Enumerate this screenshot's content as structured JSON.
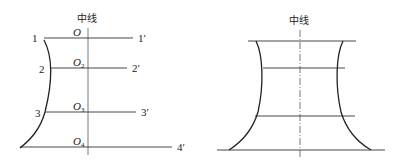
{
  "left_diagram": {
    "centerline_label": "中线",
    "origin_label": "O",
    "section_labels_left": [
      "1",
      "2",
      "3"
    ],
    "section_labels_right": [
      "1′",
      "2′",
      "3′",
      "4′"
    ],
    "center_points": [
      {
        "base": "O",
        "sub": ""
      },
      {
        "base": "O",
        "sub": "2"
      },
      {
        "base": "O",
        "sub": "3"
      },
      {
        "base": "O",
        "sub": "4"
      }
    ]
  },
  "right_diagram": {
    "centerline_label": "中线"
  },
  "colors": {
    "line": "#333333",
    "background": "#ffffff"
  }
}
